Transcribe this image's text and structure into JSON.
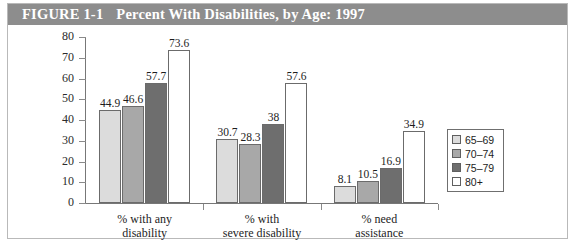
{
  "figure": {
    "number_label": "FIGURE 1-1",
    "caption": "Percent With Disabilities, by Age: 1997",
    "title_bar_color": "#8d8d8d",
    "title_text_color": "#ffffff",
    "frame_border_color": "#b9b9b9"
  },
  "chart_data": {
    "type": "bar",
    "title": "Percent With Disabilities, by Age: 1997",
    "xlabel": "",
    "ylabel": "",
    "ylim": [
      0,
      80
    ],
    "yticks": [
      0,
      10,
      20,
      30,
      40,
      50,
      60,
      70,
      80
    ],
    "ytick_labels": [
      "0",
      "10",
      "20",
      "30",
      "40",
      "50",
      "60",
      "70",
      "80"
    ],
    "grid": false,
    "legend_position": "right",
    "categories": [
      "% with any disability",
      "% with severe disability",
      "% need assistance"
    ],
    "category_lines": [
      [
        "% with any",
        "disability"
      ],
      [
        "% with",
        "severe disability"
      ],
      [
        "% need",
        "assistance"
      ]
    ],
    "series": [
      {
        "name": "65–69",
        "color": "#dcdcdc",
        "values": [
          44.9,
          30.7,
          8.1
        ],
        "labels": [
          "44.9",
          "30.7",
          "8.1"
        ]
      },
      {
        "name": "70–74",
        "color": "#a8a8a8",
        "values": [
          46.6,
          28.3,
          10.5
        ],
        "labels": [
          "46.6",
          "28.3",
          "10.5"
        ]
      },
      {
        "name": "75–79",
        "color": "#6e6e6e",
        "values": [
          57.7,
          38.0,
          16.9
        ],
        "labels": [
          "57.7",
          "38",
          "16.9"
        ]
      },
      {
        "name": "80+",
        "color": "#ffffff",
        "values": [
          73.6,
          57.6,
          34.9
        ],
        "labels": [
          "73.6",
          "57.6",
          "34.9"
        ]
      }
    ]
  },
  "legend": {
    "items": [
      {
        "label": "65–69",
        "color": "#dcdcdc"
      },
      {
        "label": "70–74",
        "color": "#a8a8a8"
      },
      {
        "label": "75–79",
        "color": "#6e6e6e"
      },
      {
        "label": "80+",
        "color": "#ffffff"
      }
    ]
  }
}
